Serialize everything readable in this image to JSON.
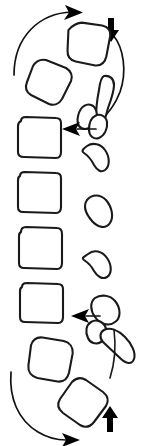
{
  "figure": {
    "title": "Lumbar spine lateral line diagram with rotational and axial load arrows",
    "view": "lateral",
    "background_color": "#ffffff",
    "stroke_color": "#1a1a1a",
    "arrow_color": "#000000",
    "width": 150,
    "height": 446,
    "label_text": ""
  },
  "vertebrae": [
    {
      "id": "vertebra-1",
      "name": "upper-rotated-vertebra-superior",
      "segment_label": "",
      "rotation_deg": -18,
      "x": 62,
      "y": 22,
      "w": 50,
      "h": 47
    },
    {
      "id": "vertebra-2",
      "name": "upper-rotated-vertebra-inferior",
      "segment_label": "",
      "rotation_deg": -14,
      "x": 25,
      "y": 55,
      "w": 48,
      "h": 46
    },
    {
      "id": "vertebra-3",
      "name": "aligned-vertebra-1",
      "segment_label": "",
      "rotation_deg": 0,
      "x": 16,
      "y": 118,
      "w": 46,
      "h": 42
    },
    {
      "id": "vertebra-4",
      "name": "aligned-vertebra-2",
      "segment_label": "",
      "rotation_deg": 0,
      "x": 16,
      "y": 172,
      "w": 46,
      "h": 43
    },
    {
      "id": "vertebra-5",
      "name": "aligned-vertebra-3",
      "segment_label": "",
      "rotation_deg": 0,
      "x": 17,
      "y": 228,
      "w": 46,
      "h": 43
    },
    {
      "id": "vertebra-6",
      "name": "aligned-vertebra-4",
      "segment_label": "",
      "rotation_deg": 0,
      "x": 18,
      "y": 283,
      "w": 46,
      "h": 42
    },
    {
      "id": "vertebra-7",
      "name": "lower-rotated-vertebra-superior",
      "segment_label": "",
      "rotation_deg": 12,
      "x": 24,
      "y": 332,
      "w": 50,
      "h": 47
    },
    {
      "id": "vertebra-8",
      "name": "lower-rotated-vertebra-inferior",
      "segment_label": "",
      "rotation_deg": 16,
      "x": 60,
      "y": 370,
      "w": 50,
      "h": 47
    }
  ],
  "posterior_elements": [
    {
      "id": "post-1",
      "name": "spinous-process-upper-long",
      "x": 98,
      "y": 88
    },
    {
      "id": "post-2",
      "name": "facet-process-upper",
      "x": 86,
      "y": 110
    },
    {
      "id": "post-3",
      "name": "spinous-process-upper-tip",
      "x": 100,
      "y": 120
    },
    {
      "id": "post-4",
      "name": "spinous-process-1",
      "x": 94,
      "y": 152
    },
    {
      "id": "post-5",
      "name": "spinous-process-2",
      "x": 94,
      "y": 205
    },
    {
      "id": "post-6",
      "name": "spinous-process-3",
      "x": 94,
      "y": 260
    },
    {
      "id": "post-7",
      "name": "spinous-process-lower-upper",
      "x": 96,
      "y": 300
    },
    {
      "id": "post-8",
      "name": "facet-process-lower",
      "x": 92,
      "y": 327
    },
    {
      "id": "post-9",
      "name": "spinous-process-lower-tip",
      "x": 116,
      "y": 338
    }
  ],
  "arrows": [
    {
      "id": "arrow-top-rotation",
      "name": "rotation-arrow-top-clockwise",
      "type": "curved",
      "direction": "clockwise",
      "head_at": "top-right",
      "meaning": "rotation"
    },
    {
      "id": "arrow-top-axial",
      "name": "axial-load-arrow-down",
      "type": "straight",
      "direction": "down",
      "meaning": "axial compression"
    },
    {
      "id": "arrow-mid-left",
      "name": "shear-arrow-upper-left",
      "type": "straight",
      "direction": "left",
      "meaning": "posterior translation"
    },
    {
      "id": "arrow-lower-left",
      "name": "shear-arrow-lower-left",
      "type": "straight",
      "direction": "left",
      "meaning": "posterior translation"
    },
    {
      "id": "arrow-bottom-rotation",
      "name": "rotation-arrow-bottom-clockwise",
      "type": "curved",
      "direction": "clockwise",
      "head_at": "bottom-right",
      "meaning": "rotation"
    },
    {
      "id": "arrow-bottom-axial",
      "name": "axial-load-arrow-up",
      "type": "straight",
      "direction": "up",
      "meaning": "axial compression"
    }
  ]
}
